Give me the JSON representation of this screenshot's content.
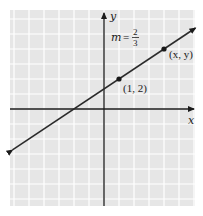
{
  "chart_data": {
    "type": "line",
    "title": "",
    "xlabel": "x",
    "ylabel": "y",
    "xlim": [
      -6,
      6
    ],
    "ylim": [
      -6.4,
      6.6
    ],
    "grid": true,
    "legend": null,
    "series": [
      {
        "name": "line",
        "equation": "y = (2/3)x + 4/3",
        "slope": "2/3",
        "x": [
          -6.1,
          6.1
        ],
        "y": [
          -2.73,
          5.4
        ],
        "arrows": "both"
      }
    ],
    "points": [
      {
        "x": 1,
        "y": 2,
        "label": "(1, 2)"
      },
      {
        "x": 4,
        "y": 4,
        "label": "(x, y)"
      }
    ],
    "annotations": [
      {
        "text": "m = 2/3",
        "numerator": "2",
        "denominator": "3",
        "position": "upper-middle"
      }
    ]
  },
  "labels": {
    "x_axis": "x",
    "y_axis": "y",
    "slope_m": "m",
    "slope_eq": "=",
    "slope_num": "2",
    "slope_den": "3",
    "point1": "(1, 2)",
    "point2": "(x, y)"
  },
  "colors": {
    "grid_bg": "#e6e6e6",
    "grid_line": "#ffffff",
    "axis": "#1a1a1a",
    "line": "#2a2a2a",
    "point": "#1a1a1a"
  }
}
